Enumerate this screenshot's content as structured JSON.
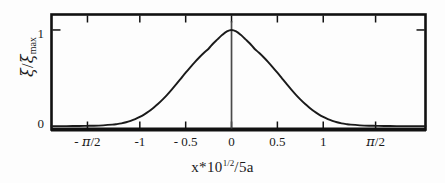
{
  "chart_data": {
    "type": "line",
    "title": "",
    "xlabel": "x * 10^(1/2) / 5a",
    "ylabel": "xi / xi_max",
    "xlabel_parts": {
      "variable": "x",
      "operator": "*",
      "base": "10",
      "exponent": "1/2",
      "divider": "/",
      "denominator": "5a"
    },
    "ylabel_parts": {
      "numerator": "ξ",
      "divider": "/",
      "denominator": "ξ",
      "denominator_sub": "max"
    },
    "xlim": [
      -1.963,
      2.115
    ],
    "ylim": [
      -0.03,
      1.16
    ],
    "grid": false,
    "legend": null,
    "xticks": [
      -1.5708,
      -1,
      -0.5,
      0,
      0.5,
      1,
      1.5708
    ],
    "xticklabels": [
      "- π/2",
      "-1",
      "- 0.5",
      "0",
      "0.5",
      "1",
      "π/2"
    ],
    "yticks": [
      0,
      1
    ],
    "yticklabels": [
      "0",
      "1"
    ],
    "tick_direction": "in",
    "frame": "box",
    "vertical_marker_x": 0,
    "curve_description": "symmetric bell-shaped (gaussian-like) profile peaking at 1 at x = 0, decaying to ~0 beyond |x| = 1.2",
    "series": [
      {
        "name": "xi/xi_max",
        "x": [
          -1.963,
          -1.8,
          -1.7,
          -1.6,
          -1.5708,
          -1.5,
          -1.4,
          -1.3,
          -1.25,
          -1.2,
          -1.15,
          -1.1,
          -1.05,
          -1.0,
          -0.95,
          -0.9,
          -0.85,
          -0.8,
          -0.75,
          -0.7,
          -0.65,
          -0.6,
          -0.55,
          -0.5,
          -0.45,
          -0.4,
          -0.35,
          -0.3,
          -0.25,
          -0.2,
          -0.15,
          -0.1,
          -0.05,
          0.0,
          0.05,
          0.1,
          0.15,
          0.2,
          0.25,
          0.3,
          0.35,
          0.4,
          0.45,
          0.5,
          0.55,
          0.6,
          0.65,
          0.7,
          0.75,
          0.8,
          0.85,
          0.9,
          0.95,
          1.0,
          1.05,
          1.1,
          1.15,
          1.2,
          1.25,
          1.3,
          1.4,
          1.5,
          1.5708,
          1.6,
          1.7,
          1.8,
          2.115
        ],
        "y": [
          0.005,
          0.005,
          0.006,
          0.007,
          0.008,
          0.009,
          0.013,
          0.02,
          0.026,
          0.034,
          0.045,
          0.06,
          0.078,
          0.1,
          0.127,
          0.158,
          0.195,
          0.236,
          0.282,
          0.332,
          0.386,
          0.442,
          0.5,
          0.558,
          0.614,
          0.668,
          0.718,
          0.764,
          0.806,
          0.86,
          0.905,
          0.95,
          0.985,
          1.0,
          0.985,
          0.95,
          0.905,
          0.86,
          0.806,
          0.764,
          0.718,
          0.668,
          0.614,
          0.558,
          0.5,
          0.442,
          0.386,
          0.332,
          0.282,
          0.236,
          0.195,
          0.158,
          0.127,
          0.1,
          0.078,
          0.06,
          0.045,
          0.034,
          0.026,
          0.02,
          0.013,
          0.009,
          0.008,
          0.007,
          0.006,
          0.005,
          0.005
        ]
      }
    ],
    "colors": {
      "curve": "#1a1a1a",
      "axis": "#111111",
      "background": "#fdfdfd",
      "marker_line": "#4a4a4a"
    }
  }
}
